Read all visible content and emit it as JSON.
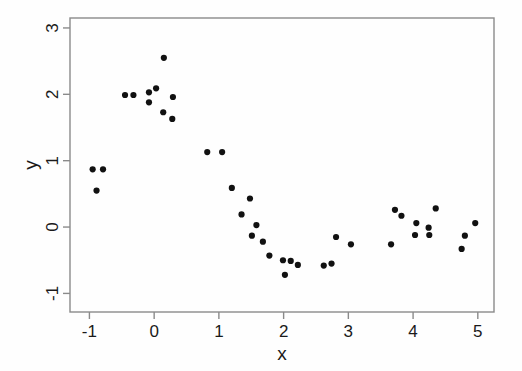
{
  "chart_data": {
    "type": "scatter",
    "title": "",
    "xlabel": "x",
    "ylabel": "y",
    "xlim": [
      -1.3,
      5.25
    ],
    "ylim": [
      -1.28,
      3.15
    ],
    "xticks": [
      -1,
      0,
      1,
      2,
      3,
      4,
      5
    ],
    "yticks": [
      -1,
      0,
      1,
      2,
      3
    ],
    "xticklabels": [
      "-1",
      "0",
      "1",
      "2",
      "3",
      "4",
      "5"
    ],
    "yticklabels": [
      "-1",
      "0",
      "1",
      "2",
      "3"
    ],
    "grid": false,
    "legend": null,
    "marker": "filled-circle",
    "marker_color": "#111111",
    "marker_size": 3.1,
    "frame_color": "#8a8a8a",
    "background": "#fefefe",
    "points": [
      {
        "x": -0.95,
        "y": 0.87
      },
      {
        "x": -0.79,
        "y": 0.87
      },
      {
        "x": -0.89,
        "y": 0.55
      },
      {
        "x": -0.45,
        "y": 1.99
      },
      {
        "x": -0.32,
        "y": 1.99
      },
      {
        "x": -0.08,
        "y": 2.03
      },
      {
        "x": -0.08,
        "y": 1.88
      },
      {
        "x": 0.03,
        "y": 2.09
      },
      {
        "x": 0.15,
        "y": 2.55
      },
      {
        "x": 0.29,
        "y": 1.96
      },
      {
        "x": 0.14,
        "y": 1.73
      },
      {
        "x": 0.28,
        "y": 1.63
      },
      {
        "x": 0.82,
        "y": 1.13
      },
      {
        "x": 1.05,
        "y": 1.13
      },
      {
        "x": 1.2,
        "y": 0.59
      },
      {
        "x": 1.48,
        "y": 0.43
      },
      {
        "x": 1.35,
        "y": 0.19
      },
      {
        "x": 1.58,
        "y": 0.03
      },
      {
        "x": 1.51,
        "y": -0.13
      },
      {
        "x": 1.68,
        "y": -0.22
      },
      {
        "x": 1.78,
        "y": -0.43
      },
      {
        "x": 1.99,
        "y": -0.5
      },
      {
        "x": 2.11,
        "y": -0.51
      },
      {
        "x": 2.22,
        "y": -0.57
      },
      {
        "x": 2.02,
        "y": -0.72
      },
      {
        "x": 2.62,
        "y": -0.58
      },
      {
        "x": 2.74,
        "y": -0.55
      },
      {
        "x": 2.81,
        "y": -0.15
      },
      {
        "x": 3.04,
        "y": -0.26
      },
      {
        "x": 3.66,
        "y": -0.26
      },
      {
        "x": 3.72,
        "y": 0.26
      },
      {
        "x": 3.82,
        "y": 0.17
      },
      {
        "x": 4.05,
        "y": 0.06
      },
      {
        "x": 4.35,
        "y": 0.28
      },
      {
        "x": 4.24,
        "y": -0.01
      },
      {
        "x": 4.03,
        "y": -0.12
      },
      {
        "x": 4.25,
        "y": -0.12
      },
      {
        "x": 4.8,
        "y": -0.13
      },
      {
        "x": 4.96,
        "y": 0.06
      },
      {
        "x": 4.75,
        "y": -0.33
      }
    ]
  }
}
